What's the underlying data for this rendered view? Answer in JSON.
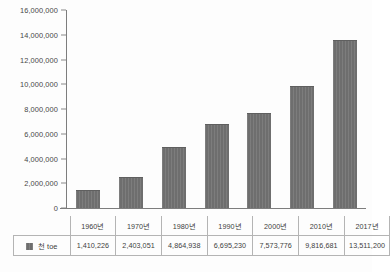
{
  "chart_data": {
    "type": "bar",
    "title": "",
    "xlabel": "",
    "ylabel": "",
    "categories": [
      "1960년",
      "1970년",
      "1980년",
      "1990년",
      "2000년",
      "2010년",
      "2017년"
    ],
    "series": [
      {
        "name": "천 toe",
        "values": [
          1410226,
          2403051,
          4864938,
          6695230,
          7573776,
          9816681,
          13511200
        ],
        "value_labels": [
          "1,410,226",
          "2,403,051",
          "4,864,938",
          "6,695,230",
          "7,573,776",
          "9,816,681",
          "13,511,200"
        ],
        "color": "#6e6e6e"
      }
    ],
    "ylim": [
      0,
      16000000
    ],
    "y_tick_values": [
      0,
      2000000,
      4000000,
      6000000,
      8000000,
      10000000,
      12000000,
      14000000,
      16000000
    ],
    "y_tick_labels": [
      "0",
      "2,000,000",
      "4,000,000",
      "6,000,000",
      "8,000,000",
      "10,000,000",
      "12,000,000",
      "14,000,000",
      "16,000,000"
    ],
    "grid": false,
    "legend_position": "table-row-left",
    "legend_entries": [
      "천 toe"
    ]
  },
  "table": {
    "legend_label": "천 toe",
    "corner_label": ""
  }
}
